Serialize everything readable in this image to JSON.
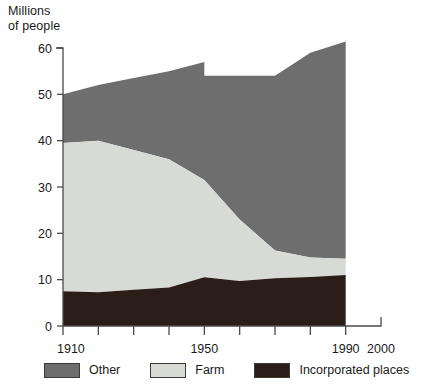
{
  "chart_data": {
    "type": "area",
    "stacked": true,
    "title": "",
    "ylabel": "Millions\nof people",
    "xlabel": "",
    "xlim": [
      1910,
      2000
    ],
    "ylim": [
      0,
      60
    ],
    "y_ticks": [
      0,
      10,
      20,
      30,
      40,
      50,
      60
    ],
    "x_ticks": [
      1910,
      1920,
      1930,
      1940,
      1950,
      1960,
      1970,
      1980,
      1990,
      2000
    ],
    "x_tick_labels": [
      "1910",
      "",
      "",
      "",
      "1950",
      "",
      "",
      "",
      "1990",
      "2000"
    ],
    "x_axis_labels_shown": [
      "1910",
      "1950",
      "1990",
      "2000"
    ],
    "grid": false,
    "legend_position": "below",
    "data_x": [
      1910,
      1920,
      1930,
      1940,
      1950,
      1960,
      1970,
      1980,
      1990
    ],
    "series": [
      {
        "name": "Incorporated places",
        "color": "#2b1d18",
        "values": [
          7.5,
          7.3,
          7.8,
          8.3,
          10.5,
          9.7,
          10.3,
          10.6,
          11.0
        ]
      },
      {
        "name": "Farm",
        "color": "#d8dad5",
        "values": [
          32.0,
          32.7,
          30.2,
          27.7,
          21.0,
          13.3,
          6.0,
          4.2,
          3.5
        ]
      },
      {
        "name": "Other",
        "color": "#6e6e6e",
        "values": [
          10.5,
          12.0,
          15.5,
          19.0,
          25.5,
          31.0,
          37.7,
          44.2,
          46.9
        ]
      }
    ],
    "cumulative_totals": [
      50.0,
      52.0,
      53.5,
      55.0,
      57.0,
      54.0,
      54.0,
      59.0,
      61.4
    ],
    "note_discontinuity": {
      "at_x": 1950,
      "total_before": 57.0,
      "total_after": 54.0
    },
    "boundaries": {
      "incorporated_top": [
        7.5,
        7.3,
        7.8,
        8.3,
        10.5,
        9.7,
        10.3,
        10.6,
        11.0
      ],
      "farm_top": [
        39.5,
        40.0,
        38.0,
        36.0,
        31.5,
        23.0,
        16.3,
        14.8,
        14.5
      ],
      "other_top": [
        50.0,
        52.0,
        53.5,
        55.0,
        57.0,
        54.0,
        54.0,
        59.0,
        61.4
      ]
    }
  },
  "axis": {
    "y_title": "Millions\nof people",
    "y_tick_labels": [
      "60",
      "50",
      "40",
      "30",
      "20",
      "10",
      "0"
    ],
    "x_tick_labels": [
      "1910",
      "1950",
      "1990",
      "2000"
    ]
  },
  "legend": {
    "items": [
      {
        "label": "Other",
        "color": "#6e6e6e"
      },
      {
        "label": "Farm",
        "color": "#d8dad5"
      },
      {
        "label": "Incorporated places",
        "color": "#2b1d18"
      }
    ]
  },
  "colors": {
    "other": "#6e6e6e",
    "farm": "#d8dad5",
    "incorporated": "#2b1d18",
    "axis": "#4a4a4a",
    "text": "#1a1a1a",
    "background": "#ffffff"
  }
}
